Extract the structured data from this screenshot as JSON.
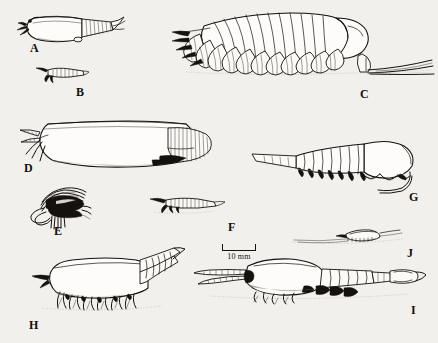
{
  "plate": {
    "title": "Comparative plate of branchiopod and malacostracan crustaceans",
    "background_color": "#f2f0ec",
    "ink_color": "#14110f",
    "width": 438,
    "height": 343
  },
  "scale_bar": {
    "label": "10 mm",
    "name": "scale-bar",
    "bar_length_px": 34,
    "position": {
      "x": 222,
      "y": 244
    }
  },
  "figures": [
    {
      "id": "A",
      "label": "A",
      "label_pos": {
        "x": 30,
        "y": 42
      },
      "description": "Bivalved carapace with short segmented abdomen and caudal furca, head appendages at left",
      "body_pos": {
        "x": 18,
        "y": 10
      },
      "body_size": {
        "w": 100,
        "h": 32
      },
      "orientation": "left-facing"
    },
    {
      "id": "B",
      "label": "B",
      "label_pos": {
        "x": 76,
        "y": 86
      },
      "description": "Small elongate crustacean with striated trunk and forked anterior appendages",
      "body_pos": {
        "x": 34,
        "y": 66
      },
      "body_size": {
        "w": 50,
        "h": 16
      },
      "orientation": "left-facing"
    },
    {
      "id": "C",
      "label": "C",
      "label_pos": {
        "x": 360,
        "y": 88
      },
      "description": "Large notostracan-like animal with many overlapping phyllopodous limbs and two long caudal filaments trailing right",
      "body_pos": {
        "x": 172,
        "y": 6
      },
      "body_size": {
        "w": 250,
        "h": 75
      },
      "orientation": "left-facing"
    },
    {
      "id": "D",
      "label": "D",
      "label_pos": {
        "x": 24,
        "y": 163
      },
      "description": "Large smooth bivalved carapace with striated posterior region and claw-like anterior appendages",
      "body_pos": {
        "x": 20,
        "y": 118
      },
      "body_size": {
        "w": 195,
        "h": 52
      },
      "orientation": "left-facing"
    },
    {
      "id": "E",
      "label": "E",
      "label_pos": {
        "x": 54,
        "y": 226
      },
      "description": "Dense dark tangle of setose head appendages, anterior view of a small filter-feeding crustacean",
      "body_pos": {
        "x": 28,
        "y": 187
      },
      "body_size": {
        "w": 62,
        "h": 42
      },
      "orientation": "right-facing"
    },
    {
      "id": "F",
      "label": "F",
      "label_pos": {
        "x": 228,
        "y": 222
      },
      "description": "Small slender crustacean with striated thorax and pointed rostrum",
      "body_pos": {
        "x": 150,
        "y": 196
      },
      "body_size": {
        "w": 72,
        "h": 18
      },
      "orientation": "left-facing"
    },
    {
      "id": "G",
      "label": "G",
      "label_pos": {
        "x": 409,
        "y": 192
      },
      "description": "Segmented animal with long tapering abdomen to the left, bulbous head at right with curved antennae",
      "body_pos": {
        "x": 252,
        "y": 135
      },
      "body_size": {
        "w": 168,
        "h": 58
      },
      "orientation": "right-facing"
    },
    {
      "id": "H",
      "label": "H",
      "label_pos": {
        "x": 29,
        "y": 320
      },
      "description": "Stout-bodied animal standing on numerous thin legs, segmented tapering tail pointing upper right",
      "body_pos": {
        "x": 30,
        "y": 248
      },
      "body_size": {
        "w": 152,
        "h": 66
      },
      "orientation": "left-facing"
    },
    {
      "id": "I",
      "label": "I",
      "label_pos": {
        "x": 411,
        "y": 305
      },
      "description": "Elongate mysid-like crustacean with long antennae at left, oval carapace, segmented pleon and telson at right",
      "body_pos": {
        "x": 196,
        "y": 258
      },
      "body_size": {
        "w": 222,
        "h": 48
      },
      "orientation": "left-facing"
    },
    {
      "id": "J",
      "label": "J",
      "label_pos": {
        "x": 407,
        "y": 248
      },
      "description": "Very small crustacean resting on substrate with fine trailing antennae",
      "body_pos": {
        "x": 292,
        "y": 228
      },
      "body_size": {
        "w": 108,
        "h": 20
      },
      "orientation": "right-facing"
    }
  ]
}
